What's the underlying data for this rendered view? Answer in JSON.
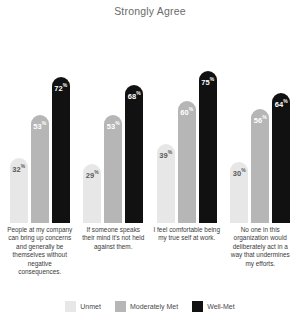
{
  "chart_data": {
    "type": "bar",
    "title": "Strongly Agree",
    "xlabel": "",
    "ylabel": "",
    "ylim": [
      0,
      100
    ],
    "grid": false,
    "legend_position": "bottom",
    "value_suffix": "%",
    "categories": [
      "People at my company can bring up concerns and generally be themselves without negative consequences.",
      "If someone speaks their mind it's not held against them.",
      "I feel comfortable being my true self at work.",
      "No one in this organization would deliberately act in a way that undermines my efforts."
    ],
    "series": [
      {
        "name": "Unmet",
        "color": "#e7e7e7",
        "values": [
          32,
          29,
          39,
          30
        ]
      },
      {
        "name": "Moderately Met",
        "color": "#b6b6b6",
        "values": [
          53,
          53,
          60,
          56
        ]
      },
      {
        "name": "Well-Met",
        "color": "#111111",
        "values": [
          72,
          68,
          75,
          64
        ]
      }
    ]
  },
  "legend": {
    "items": [
      {
        "label": "Unmet",
        "color": "#e7e7e7"
      },
      {
        "label": "Moderately Met",
        "color": "#b6b6b6"
      },
      {
        "label": "Well-Met",
        "color": "#111111"
      }
    ]
  }
}
